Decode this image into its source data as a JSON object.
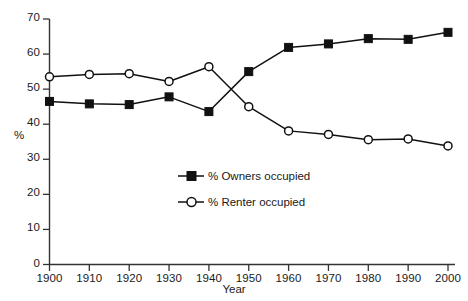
{
  "chart_data": {
    "type": "line",
    "title": "",
    "xlabel": "Year",
    "ylabel": "%",
    "categories": [
      "1900",
      "1910",
      "1920",
      "1930",
      "1940",
      "1950",
      "1960",
      "1970",
      "1980",
      "1990",
      "2000"
    ],
    "x": [
      1900,
      1910,
      1920,
      1930,
      1940,
      1950,
      1960,
      1970,
      1980,
      1990,
      2000
    ],
    "xlim": [
      1900,
      2000
    ],
    "ylim": [
      0,
      70
    ],
    "yticks": [
      0,
      10,
      20,
      30,
      40,
      50,
      60,
      70
    ],
    "ytick_labels": [
      "0",
      "10",
      "20",
      "30",
      "40",
      "50",
      "60",
      "70"
    ],
    "xticks": [
      1900,
      1910,
      1920,
      1930,
      1940,
      1950,
      1960,
      1970,
      1980,
      1990,
      2000
    ],
    "xtick_labels": [
      "1900",
      "1910",
      "1920",
      "1930",
      "1940",
      "1950",
      "1960",
      "1970",
      "1980",
      "1990",
      "2000"
    ],
    "grid": false,
    "legend_position": "center",
    "series": [
      {
        "name": "% Owners occupied",
        "marker": "filled-square",
        "color": "#111111",
        "values": [
          46.5,
          45.8,
          45.6,
          47.8,
          43.6,
          55.0,
          61.9,
          62.9,
          64.4,
          64.2,
          66.2
        ]
      },
      {
        "name": "% Renter occupied",
        "marker": "open-circle",
        "color": "#111111",
        "values": [
          53.5,
          54.2,
          54.4,
          52.2,
          56.4,
          45.0,
          38.1,
          37.1,
          35.6,
          35.8,
          33.8
        ]
      }
    ]
  },
  "axes": {
    "x_title": "Year",
    "y_title": "%"
  },
  "legend": {
    "items": [
      {
        "label": "% Owners occupied",
        "marker": "filled-square"
      },
      {
        "label": "% Renter occupied",
        "marker": "open-circle"
      }
    ]
  }
}
